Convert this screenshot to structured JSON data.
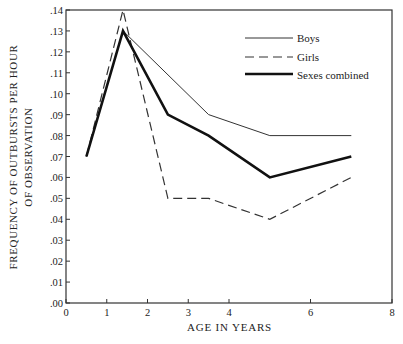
{
  "chart_data": {
    "type": "line",
    "title": "",
    "xlabel": "AGE IN YEARS",
    "ylabel": "FREQUENCY OF OUTBURSTS PER HOUR OF OBSERVATION",
    "ylabel_lines": [
      "FREQUENCY OF OUTBURSTS PER HOUR",
      "OF OBSERVATION"
    ],
    "xlim": [
      0,
      8
    ],
    "ylim": [
      0.0,
      0.14
    ],
    "x_ticks": [
      0,
      1,
      2,
      3,
      4,
      6,
      8
    ],
    "x_tick_labels": [
      "0",
      "1",
      "2",
      "3",
      "4",
      "6",
      "8"
    ],
    "y_ticks": [
      0.0,
      0.01,
      0.02,
      0.03,
      0.04,
      0.05,
      0.06,
      0.07,
      0.08,
      0.09,
      0.1,
      0.11,
      0.12,
      0.13,
      0.14
    ],
    "y_tick_labels": [
      ".00",
      ".01",
      ".02",
      ".03",
      ".04",
      ".05",
      ".06",
      ".07",
      ".08",
      ".09",
      ".10",
      ".11",
      ".12",
      ".13",
      ".14"
    ],
    "grid": false,
    "legend_position": "upper right",
    "series": [
      {
        "name": "Boys",
        "style": "thin-solid",
        "x": [
          0.5,
          1.4,
          3.5,
          5.0,
          7.0
        ],
        "values": [
          0.07,
          0.13,
          0.09,
          0.08,
          0.08
        ]
      },
      {
        "name": "Girls",
        "style": "dashed",
        "x": [
          0.5,
          1.4,
          2.5,
          3.5,
          5.0,
          7.0
        ],
        "values": [
          0.07,
          0.14,
          0.05,
          0.05,
          0.04,
          0.06
        ]
      },
      {
        "name": "Sexes combined",
        "style": "thick-solid",
        "x": [
          0.5,
          1.4,
          2.5,
          3.5,
          5.0,
          7.0
        ],
        "values": [
          0.07,
          0.13,
          0.09,
          0.08,
          0.06,
          0.07
        ]
      }
    ]
  },
  "legend": {
    "boys": "Boys",
    "girls": "Girls",
    "combined": "Sexes combined"
  },
  "labels": {
    "x": "AGE IN YEARS",
    "y_line1": "FREQUENCY OF OUTBURSTS PER HOUR",
    "y_line2": "OF OBSERVATION"
  }
}
